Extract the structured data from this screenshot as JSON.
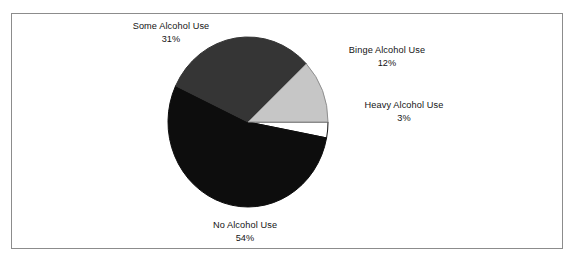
{
  "figure": {
    "background_color": "#ffffff",
    "frame_color": "#8c8c8c"
  },
  "chart_data": {
    "type": "pie",
    "title": "",
    "subtitle": "",
    "xlabel": "",
    "ylabel": "",
    "legend_position": "none",
    "grid": false,
    "units": "percent",
    "start_angle_deg": 0,
    "direction": "clockwise",
    "categories": [
      "Heavy Alcohol Use",
      "No Alcohol Use",
      "Some Alcohol Use",
      "Binge Alcohol Use"
    ],
    "values": [
      3,
      54,
      31,
      12
    ],
    "slices": [
      {
        "label": "Heavy Alcohol Use",
        "value": 3,
        "value_text": "3%",
        "color": "#ffffff",
        "outline_color": "#111111",
        "start_deg": 0,
        "end_deg": 10.8
      },
      {
        "label": "No Alcohol Use",
        "value": 54,
        "value_text": "54%",
        "color": "#0d0d0d",
        "outline_color": "#0d0d0d",
        "start_deg": 10.8,
        "end_deg": 205.2
      },
      {
        "label": "Some Alcohol Use",
        "value": 31,
        "value_text": "31%",
        "color": "#353535",
        "outline_color": "#353535",
        "start_deg": 205.2,
        "end_deg": 316.8
      },
      {
        "label": "Binge Alcohol Use",
        "value": 12,
        "value_text": "12%",
        "color": "#c6c6c6",
        "outline_color": "#8f8f8f",
        "start_deg": 316.8,
        "end_deg": 360
      }
    ]
  },
  "labels": {
    "some": {
      "name": "Some Alcohol Use",
      "value": "31%"
    },
    "binge": {
      "name": "Binge Alcohol Use",
      "value": "12%"
    },
    "heavy": {
      "name": "Heavy Alcohol Use",
      "value": "3%"
    },
    "no": {
      "name": "No Alcohol Use",
      "value": "54%"
    }
  }
}
